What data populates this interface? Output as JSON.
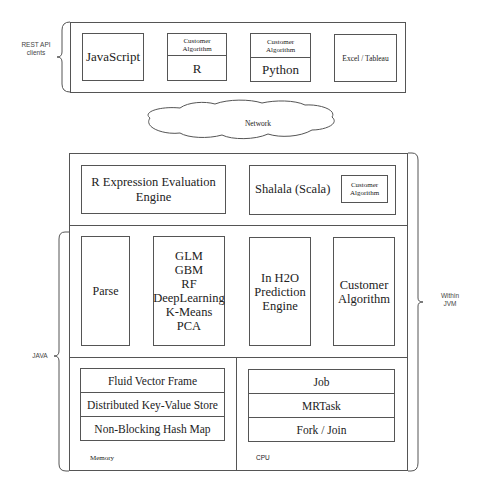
{
  "clients": {
    "label": "REST API clients",
    "label_lines": [
      "REST API",
      "clients"
    ],
    "items": [
      {
        "name": "JavaScript"
      },
      {
        "header": "Customer Algorithm",
        "header_lines": [
          "Customer",
          "Algorithm"
        ],
        "name": "R"
      },
      {
        "header": "Customer Algorithm",
        "header_lines": [
          "Customer",
          "Algorithm"
        ],
        "name": "Python"
      },
      {
        "name": "Excel / Tableau"
      }
    ]
  },
  "network": {
    "label": "Network"
  },
  "jvm": {
    "label": "Within JVM",
    "label_lines": [
      "Within",
      "JVM"
    ],
    "engines": {
      "r_engine": {
        "lines": [
          "R Expression Evaluation",
          "Engine"
        ]
      },
      "shalala": {
        "label": "Shalala (Scala)",
        "inner_lines": [
          "Customer",
          "Algorithm"
        ]
      }
    },
    "algorithms": {
      "parse": {
        "label": "Parse"
      },
      "models": {
        "lines": [
          "GLM",
          "GBM",
          "RF",
          "DeepLearning",
          "K-Means",
          "PCA"
        ]
      },
      "prediction": {
        "lines": [
          "In H2O",
          "Prediction",
          "Engine"
        ]
      },
      "custom": {
        "lines": [
          "Customer",
          "Algorithm"
        ]
      }
    },
    "memory": {
      "label": "Memory",
      "rows": [
        "Fluid Vector Frame",
        "Distributed Key-Value Store",
        "Non-Blocking Hash Map"
      ]
    },
    "cpu": {
      "label": "CPU",
      "rows": [
        "Job",
        "MRTask",
        "Fork / Join"
      ]
    }
  },
  "java": {
    "label": "JAVA"
  },
  "colors": {
    "stroke": "#555555",
    "text": "#222222",
    "background": "#ffffff"
  }
}
